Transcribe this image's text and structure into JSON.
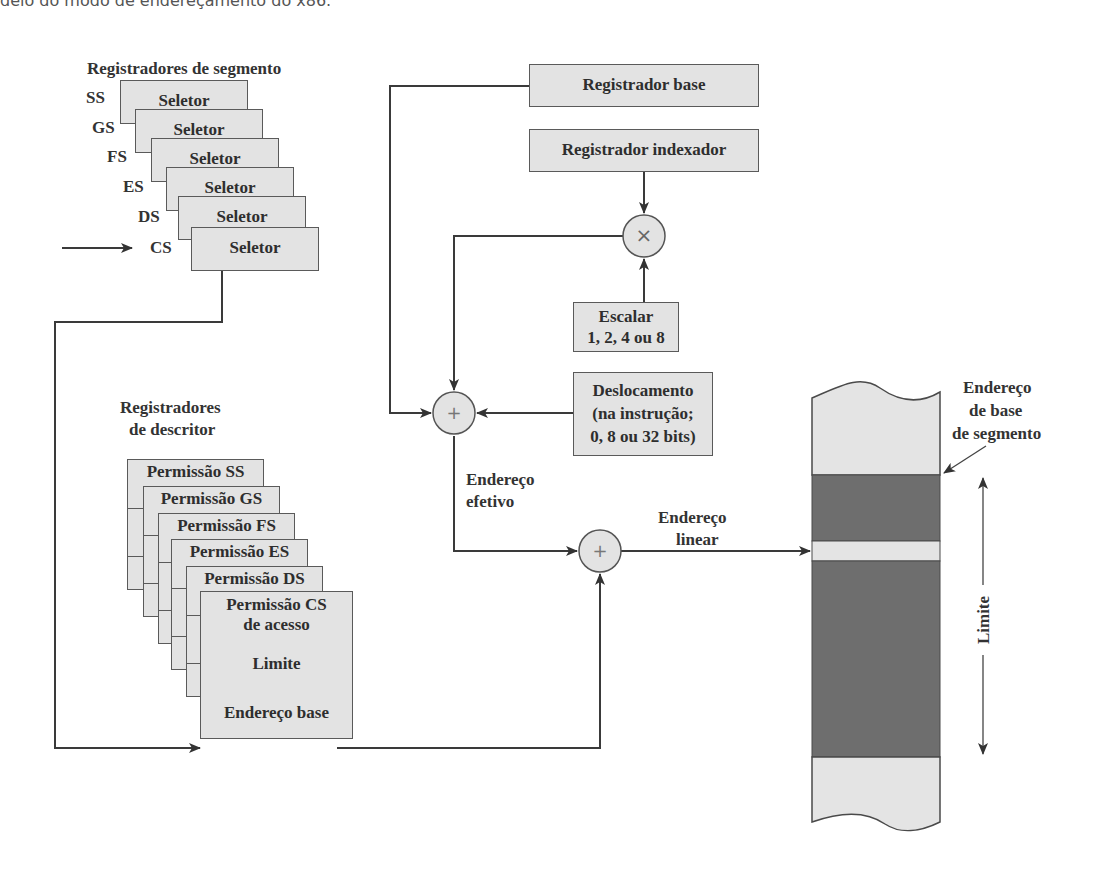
{
  "caption": "delo do modo de endereçamento do x86.",
  "segment_registers": {
    "title": "Registradores de segmento",
    "items": [
      {
        "name": "SS",
        "field": "Seletor"
      },
      {
        "name": "GS",
        "field": "Seletor"
      },
      {
        "name": "FS",
        "field": "Seletor"
      },
      {
        "name": "ES",
        "field": "Seletor"
      },
      {
        "name": "DS",
        "field": "Seletor"
      },
      {
        "name": "CS",
        "field": "Seletor"
      }
    ]
  },
  "descriptor_registers": {
    "title_line1": "Registradores",
    "title_line2": "de descritor",
    "items": [
      {
        "label": "Permissão SS"
      },
      {
        "label": "Permissão GS"
      },
      {
        "label": "Permissão FS"
      },
      {
        "label": "Permissão ES"
      },
      {
        "label": "Permissão DS"
      }
    ],
    "front": {
      "access_line1": "Permissão CS",
      "access_line2": "de acesso",
      "limit": "Limite",
      "base": "Endereço base"
    }
  },
  "address_calc": {
    "base_register": "Registrador base",
    "index_register": "Registrador indexador",
    "multiply_symbol": "×",
    "scale_line1": "Escalar",
    "scale_line2": "1, 2, 4 ou 8",
    "disp_line1": "Deslocamento",
    "disp_line2": "(na instrução;",
    "disp_line3": "0, 8 ou 32 bits)",
    "add_symbol": "+",
    "effective_line1": "Endereço",
    "effective_line2": "efetivo",
    "linear_line1": "Endereço",
    "linear_line2": "linear"
  },
  "memory": {
    "segment_base_line1": "Endereço",
    "segment_base_line2": "de base",
    "segment_base_line3": "de segmento",
    "limit_label": "Limite",
    "colors": {
      "light": "#e4e4e4",
      "dark": "#6e6e6e",
      "line": "#4a4a4a"
    }
  }
}
